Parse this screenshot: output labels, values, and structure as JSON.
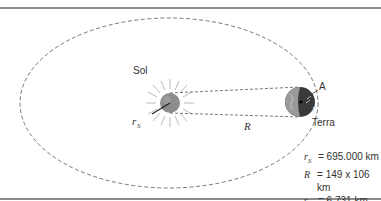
{
  "diagram": {
    "labels": {
      "sun": "Sol",
      "earth": "Terra",
      "point_a": "A",
      "sun_radius_symbol": "r",
      "sun_radius_sub": "S",
      "distance_symbol": "R",
      "earth_radius_symbol": "r"
    },
    "legend": [
      {
        "symbol": "r",
        "sub": "S",
        "value": "= 695.000 km"
      },
      {
        "symbol": "R",
        "sub": "",
        "value": "= 149 x 106 km"
      },
      {
        "symbol": "r",
        "sub": "",
        "value": "= 6.731 km"
      }
    ],
    "colors": {
      "orbit": "#555555",
      "sun": "#8c8c8c",
      "earth_dark": "#3a3a3a",
      "earth_light": "#9a9a9a",
      "rays": "#bbbbbb",
      "frame": "#8a8a8a"
    }
  }
}
